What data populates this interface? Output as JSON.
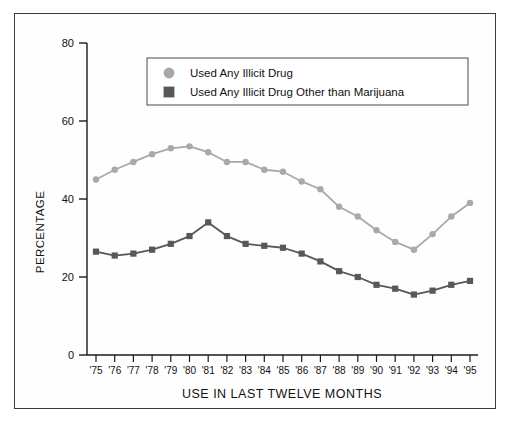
{
  "chart_data": {
    "type": "line",
    "title": "",
    "xlabel": "USE IN LAST TWELVE MONTHS",
    "ylabel": "PERCENTAGE",
    "ylim": [
      0,
      80
    ],
    "yticks": [
      0,
      20,
      40,
      60,
      80
    ],
    "grid": false,
    "legend_position": "upper-center",
    "categories": [
      "'75",
      "'76",
      "'77",
      "'78",
      "'79",
      "'80",
      "'81",
      "'82",
      "'83",
      "'84",
      "'85",
      "'86",
      "'87",
      "'88",
      "'89",
      "'90",
      "'91",
      "'92",
      "'93",
      "'94",
      "'95"
    ],
    "series": [
      {
        "name": "Used Any Illicit Drug",
        "marker": "circle",
        "color": "#a9a9a9",
        "values": [
          45.0,
          47.5,
          49.5,
          51.5,
          53.0,
          53.5,
          52.0,
          49.5,
          49.5,
          47.5,
          47.0,
          44.5,
          42.5,
          38.0,
          35.5,
          32.0,
          29.0,
          27.0,
          31.0,
          35.5,
          39.0
        ]
      },
      {
        "name": "Used Any Illicit Drug Other than Marijuana",
        "marker": "square",
        "color": "#585858",
        "values": [
          26.5,
          25.5,
          26.0,
          27.0,
          28.5,
          30.5,
          34.0,
          30.5,
          28.5,
          28.0,
          27.5,
          26.0,
          24.0,
          21.5,
          20.0,
          18.0,
          17.0,
          15.5,
          16.5,
          18.0,
          19.0
        ]
      }
    ]
  },
  "legend": {
    "items": [
      {
        "label": "Used Any Illicit Drug",
        "marker": "circle",
        "color": "#a9a9a9"
      },
      {
        "label": "Used Any Illicit Drug Other than Marijuana",
        "marker": "square",
        "color": "#585858"
      }
    ]
  },
  "axes": {
    "y_title": "PERCENTAGE",
    "x_title": "USE IN LAST TWELVE MONTHS",
    "y_tick_labels": [
      "0",
      "20",
      "40",
      "60",
      "80"
    ],
    "x_tick_labels": [
      "'75",
      "'76",
      "'77",
      "'78",
      "'79",
      "'80",
      "'81",
      "'82",
      "'83",
      "'84",
      "'85",
      "'86",
      "'87",
      "'88",
      "'89",
      "'90",
      "'91",
      "'92",
      "'93",
      "'94",
      "'95"
    ]
  }
}
